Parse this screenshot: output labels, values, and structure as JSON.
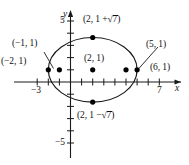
{
  "figure": {
    "kind": "coordinate-plane-ellipse-graph",
    "axes": {
      "x_label": "x",
      "y_label": "y",
      "x_tick_labels": [
        {
          "value": -3,
          "text": "−3"
        },
        {
          "value": 7,
          "text": "7"
        }
      ],
      "y_tick_labels": [
        {
          "value": 5,
          "text": "5"
        },
        {
          "value": -5,
          "text": "−5"
        }
      ],
      "xlim": [
        -3.9,
        8.1
      ],
      "ylim": [
        -5.9,
        5.9
      ],
      "x_ticks": [
        -3,
        -2,
        -1,
        0,
        1,
        2,
        3,
        4,
        5,
        6,
        7
      ],
      "y_ticks": [
        -5,
        -4,
        -3,
        -2,
        -1,
        1,
        2,
        3,
        4,
        5
      ]
    },
    "curve": {
      "type": "ellipse",
      "center": [
        2,
        1
      ],
      "semi_axis_x": 4,
      "semi_axis_y": 2.6458,
      "stroke": "#1a1a1a"
    },
    "points": [
      {
        "id": "vertex-left",
        "x": -2,
        "y": 1,
        "label": "(−2, 1)",
        "label_pos": "left"
      },
      {
        "id": "focus-left",
        "x": -1,
        "y": 1,
        "label": "(−1, 1)",
        "label_pos": "upper-left"
      },
      {
        "id": "center",
        "x": 2,
        "y": 1,
        "label": "(2, 1)",
        "label_pos": "above"
      },
      {
        "id": "focus-right",
        "x": 5,
        "y": 1,
        "label": "(5, 1)",
        "label_pos": "upper-right"
      },
      {
        "id": "vertex-right",
        "x": 6,
        "y": 1,
        "label": "(6, 1)",
        "label_pos": "right"
      },
      {
        "id": "co-vertex-top",
        "x": 2,
        "y": 3.6458,
        "label": "(2, 1 + √7)",
        "label_pos": "above-right"
      },
      {
        "id": "co-vertex-bot",
        "x": 2,
        "y": -1.6458,
        "label": "(2, 1 − √7)",
        "label_pos": "below-right"
      }
    ],
    "labels": {
      "top_point": {
        "prefix": "(2, 1 +",
        "radical": "7",
        "suffix": ")"
      },
      "bottom_point": {
        "prefix": "(2, 1 −",
        "radical": "7",
        "suffix": ")"
      },
      "vertex_left": "(−2, 1)",
      "focus_left": "(−1, 1)",
      "center": "(2, 1)",
      "focus_right": "(5, 1)",
      "vertex_right": "(6, 1)"
    },
    "colors": {
      "stroke": "#1a1a1a",
      "point_fill": "#000000",
      "background": "#ffffff"
    }
  }
}
